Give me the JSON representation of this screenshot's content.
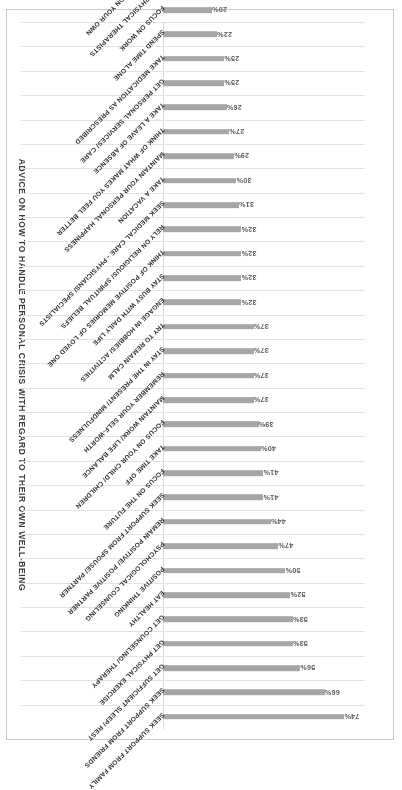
{
  "chart_data": {
    "type": "bar",
    "orientation": "horizontal",
    "title": "ADVICE ON HOW TO HANDLE PERSONAL CRISIS WITH REGARD TO THEIR OWN WELL-BEING",
    "xlabel": "",
    "ylabel": "",
    "xlim": [
      0,
      80
    ],
    "grid": true,
    "legend": false,
    "rotated_180": true,
    "bar_color": "#a6a6a6",
    "gridline_color": "#e2e2e2",
    "value_suffix": "%",
    "categories": [
      "SEEK SUPPORT FROM FAMILY",
      "SEEK SUPPORT FROM FRIENDS",
      "GET SUFFICIENT SLEEP/ REST",
      "GET PHYSICAL EXERCISE",
      "GET COUNSELING/ THERAPY",
      "EAT HEALTHY",
      "POSITIVE THINKING",
      "PSYCHOLOGICAL COUNSELING",
      "REMAIN POSITIVE/ POSITIVE PARTNER",
      "SEEK SUPPORT FROM SPOUSE/ PARTNER",
      "FOCUS ON THE FUTURE",
      "TAKE TIME OFF",
      "FOCUS ON YOUR CHILD/ CHILDREN",
      "MAINTAIN WORK/ LIFE BALANCE",
      "REMEMBER YOUR SELF-WORTH",
      "STAY IN THE PRESENT/ MINDFULNESS",
      "TRY TO REMAIN CALM",
      "ENGAGE IN HOBBIES/ ACTIVITIES",
      "STAY BUSY WITH DAILY LIFE",
      "THINK OF POSITIVE MEMORIES OF LOVED ONE",
      "RELY ON RELIGIOUS/ SPIRITUAL BELIEFS",
      "SEEK MEDICAL CARE - PHYSICIANS/ SPECIALISTS",
      "TAKE A VACATION",
      "MAINTAIN YOUR PERSONAL HAPPINESS",
      "THINK OF WHAT MAKES YOU FEEL BETTER",
      "TAKE A LEAVE OF ABSENCE",
      "GET PERSONAL SERVICES/ CARE",
      "TAKE MEDICATION AS PRESCRIBED",
      "SPEND TIME ALONE",
      "FOCUS ON WORK",
      "SEEK PHYSICAL THERAPISTS",
      "HANDLE CRISIS ON YOUR OWN"
    ],
    "values": [
      74,
      66,
      56,
      53,
      53,
      52,
      50,
      47,
      44,
      41,
      41,
      40,
      39,
      37,
      37,
      37,
      37,
      32,
      32,
      32,
      32,
      31,
      30,
      29,
      27,
      26,
      25,
      25,
      22,
      20,
      13,
      10
    ],
    "value_labels": [
      "74%",
      "66%",
      "56%",
      "53%",
      "53%",
      "52%",
      "50%",
      "47%",
      "44%",
      "41%",
      "41%",
      "40%",
      "39%",
      "37%",
      "37%",
      "37%",
      "37%",
      "32%",
      "32%",
      "32%",
      "32%",
      "31%",
      "30%",
      "29%",
      "27%",
      "26%",
      "25%",
      "25%",
      "22%",
      "20%",
      "13%",
      "10%"
    ]
  }
}
